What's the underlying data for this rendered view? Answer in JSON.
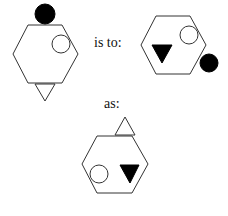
{
  "analogy": {
    "connector_1": "is to:",
    "connector_2": "as:"
  },
  "figures": [
    {
      "id": "figure-a",
      "shapes": [
        "hexagon-outline",
        "filled-circle-top",
        "open-circle-upper-right",
        "open-triangle-pointing-down-bottom"
      ]
    },
    {
      "id": "figure-b",
      "shapes": [
        "hexagon-outline",
        "open-circle-upper-right",
        "filled-triangle-pointing-down-lower-left",
        "filled-circle-lower-right-outside"
      ]
    },
    {
      "id": "figure-c",
      "shapes": [
        "hexagon-outline",
        "open-triangle-pointing-up-top",
        "open-circle-lower-left",
        "filled-triangle-pointing-down-lower-right"
      ]
    }
  ],
  "colors": {
    "stroke": "#333333",
    "fill": "#000000",
    "background": "#ffffff"
  }
}
